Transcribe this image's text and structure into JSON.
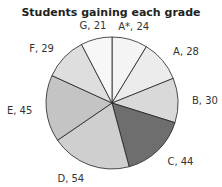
{
  "chart_data": {
    "type": "pie",
    "title": "Students gaining each grade",
    "start": "top",
    "direction": "clockwise",
    "slices": [
      {
        "label": "A*",
        "value": 24,
        "color": "#f4f4f4",
        "text": "A*, 24"
      },
      {
        "label": "A",
        "value": 28,
        "color": "#ececec",
        "text": "A, 28"
      },
      {
        "label": "B",
        "value": 30,
        "color": "#d9d9d9",
        "text": "B, 30"
      },
      {
        "label": "C",
        "value": 44,
        "color": "#6e6e6e",
        "text": "C, 44"
      },
      {
        "label": "D",
        "value": 54,
        "color": "#cfcfcf",
        "text": "D, 54"
      },
      {
        "label": "E",
        "value": 45,
        "color": "#c4c4c4",
        "text": "E, 45"
      },
      {
        "label": "F",
        "value": 29,
        "color": "#dedede",
        "text": "F, 29"
      },
      {
        "label": "G",
        "value": 21,
        "color": "#f7f7f7",
        "text": "G, 21"
      }
    ]
  }
}
